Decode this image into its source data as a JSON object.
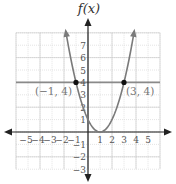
{
  "chart_data": {
    "type": "line",
    "title": "",
    "xlabel": "",
    "ylabel": "f(x)",
    "xlim": [
      -6,
      6
    ],
    "ylim": [
      -3,
      8
    ],
    "grid": true,
    "x_ticks": [
      "-5",
      "-4",
      "-3",
      "-2",
      "-1",
      "1",
      "2",
      "3",
      "4",
      "5"
    ],
    "x_tick_values": [
      -5,
      -4,
      -3,
      -2,
      -1,
      1,
      2,
      3,
      4,
      5
    ],
    "y_ticks": [
      "-3",
      "-2",
      "-1",
      "1",
      "2",
      "3",
      "4",
      "5",
      "6",
      "7"
    ],
    "y_tick_values": [
      -3,
      -2,
      -1,
      1,
      2,
      3,
      4,
      5,
      6,
      7
    ],
    "series": [
      {
        "name": "parabola",
        "kind": "curve",
        "equation": "f(x) = (x - 1)^2",
        "x": [
          -1.8,
          -1,
          0,
          1,
          2,
          3,
          3.8
        ],
        "y": [
          7.84,
          4,
          1,
          0,
          1,
          4,
          7.84
        ],
        "arrows": "both-ends-up"
      },
      {
        "name": "horizontal line",
        "kind": "line",
        "equation": "y = 4",
        "x": [
          -6,
          6
        ],
        "y": [
          4,
          4
        ]
      }
    ],
    "points": [
      {
        "x": -1,
        "y": 4,
        "label": "(−1, 4)"
      },
      {
        "x": 3,
        "y": 4,
        "label": "(3, 4)"
      }
    ],
    "colors": {
      "curve": "#7a7a7a",
      "axis": "#222222",
      "hline": "#8a8a8a",
      "grid_major": "#c8c8c8",
      "grid_minor": "#dddddd",
      "point": "#111111",
      "labels": "#777777"
    }
  }
}
